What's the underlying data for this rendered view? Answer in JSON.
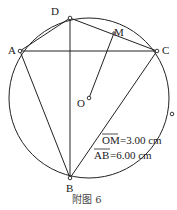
{
  "figure": {
    "caption": "附图 6",
    "points": {
      "A": "A",
      "B": "B",
      "C": "C",
      "D": "D",
      "M": "M",
      "O": "O"
    },
    "segments": [
      "AD",
      "DC",
      "AC",
      "AB",
      "DB",
      "CB",
      "OM"
    ],
    "measurements": [
      {
        "name": "OM",
        "label": "OM",
        "value": "=3.00 cm"
      },
      {
        "name": "AB",
        "label": "AB",
        "value": "=6.00 cm"
      }
    ]
  }
}
